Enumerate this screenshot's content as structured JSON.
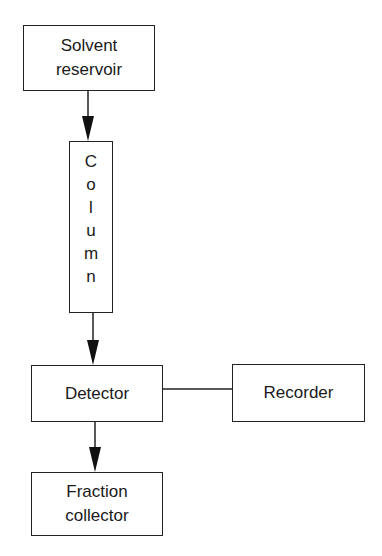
{
  "diagram": {
    "type": "flowchart",
    "nodes": [
      {
        "id": "solvent",
        "lines": [
          "Solvent",
          "reservoir"
        ]
      },
      {
        "id": "column",
        "letters": [
          "C",
          "o",
          "l",
          "u",
          "m",
          "n"
        ]
      },
      {
        "id": "detector",
        "lines": [
          "Detector"
        ]
      },
      {
        "id": "recorder",
        "lines": [
          "Recorder"
        ]
      },
      {
        "id": "fraction",
        "lines": [
          "Fraction",
          "collector"
        ]
      }
    ],
    "edges": [
      {
        "from": "solvent",
        "to": "column",
        "style": "arrow"
      },
      {
        "from": "column",
        "to": "detector",
        "style": "arrow"
      },
      {
        "from": "detector",
        "to": "recorder",
        "style": "line"
      },
      {
        "from": "detector",
        "to": "fraction",
        "style": "arrow"
      }
    ],
    "colors": {
      "stroke": "#222222",
      "background": "#ffffff",
      "text": "#1a1a1a"
    }
  }
}
